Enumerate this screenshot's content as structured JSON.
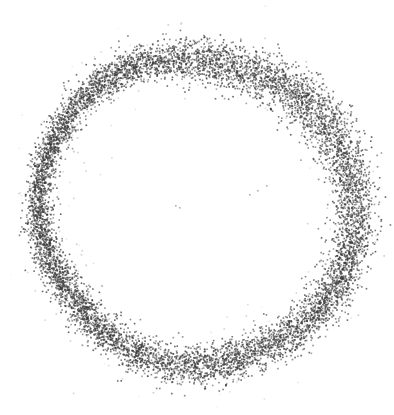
{
  "figure": {
    "width": 394,
    "height": 415,
    "background_color": "#ffffff",
    "title": "",
    "has_axes": false,
    "has_grid": false,
    "has_legend": false,
    "has_tick_labels": false,
    "has_frame": false
  },
  "chart_data": {
    "type": "scatter",
    "title": "",
    "subtitle": "",
    "xlabel": "",
    "ylabel": "",
    "xlim": [
      0,
      394
    ],
    "ylim": [
      0,
      415
    ],
    "grid": false,
    "legend": null,
    "legend_position": "none",
    "annotations": [],
    "axis_visible": false,
    "tick_labels": {
      "x": [],
      "y": []
    },
    "series": [
      {
        "name": "ring-points",
        "marker": "point",
        "marker_size": 1.6,
        "color": "#3a3a3a",
        "opacity": 0.82,
        "point_count": 9000,
        "distribution": "annulus",
        "center_x": 196,
        "center_y": 210,
        "radius_mean": 155,
        "radius_sigma": 9.5,
        "angular_uniform": true,
        "radius_wobble_amplitude": 7.0,
        "thickness_wobble_amplitude": 3.2,
        "seed": 20240517
      },
      {
        "name": "center-outliers",
        "marker": "point",
        "marker_size": 1.6,
        "color": "#6e6e6e",
        "opacity": 0.55,
        "point_count": 7,
        "distribution": "manual",
        "points": [
          [
            175,
            205
          ],
          [
            179,
            207
          ],
          [
            249,
            194
          ],
          [
            257,
            190
          ],
          [
            266,
            185
          ],
          [
            216,
            355
          ],
          [
            206,
            366
          ]
        ]
      }
    ]
  }
}
